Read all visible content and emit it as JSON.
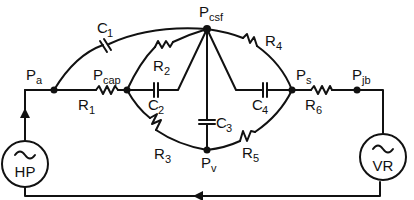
{
  "diagram": {
    "type": "electrical circuit analog model",
    "nodes": [
      {
        "id": "Pa",
        "main": "P",
        "sub": "a"
      },
      {
        "id": "Pcap",
        "main": "P",
        "sub": "cap"
      },
      {
        "id": "Pcsf",
        "main": "P",
        "sub": "csf"
      },
      {
        "id": "Ps",
        "main": "P",
        "sub": "s"
      },
      {
        "id": "Pjb",
        "main": "P",
        "sub": "jb"
      },
      {
        "id": "Pv",
        "main": "P",
        "sub": "v"
      }
    ],
    "components": [
      {
        "id": "C1",
        "kind": "capacitor",
        "main": "C",
        "sub": "1",
        "between": [
          "Pa",
          "Pcsf"
        ]
      },
      {
        "id": "R1",
        "kind": "resistor",
        "main": "R",
        "sub": "1",
        "between": [
          "Pa",
          "Pcap"
        ]
      },
      {
        "id": "R2",
        "kind": "resistor",
        "main": "R",
        "sub": "2",
        "between": [
          "Pcap",
          "Pcsf"
        ]
      },
      {
        "id": "C2",
        "kind": "capacitor",
        "main": "C",
        "sub": "2",
        "between": [
          "Pcap",
          "Pcsf"
        ]
      },
      {
        "id": "R3",
        "kind": "resistor",
        "main": "R",
        "sub": "3",
        "between": [
          "Pcap",
          "Pv"
        ]
      },
      {
        "id": "C3",
        "kind": "capacitor",
        "main": "C",
        "sub": "3",
        "between": [
          "Pcsf",
          "Pv"
        ]
      },
      {
        "id": "R4",
        "kind": "resistor",
        "main": "R",
        "sub": "4",
        "between": [
          "Pcsf",
          "Ps"
        ]
      },
      {
        "id": "C4",
        "kind": "capacitor",
        "main": "C",
        "sub": "4",
        "between": [
          "Pcsf",
          "Ps"
        ]
      },
      {
        "id": "R5",
        "kind": "resistor",
        "main": "R",
        "sub": "5",
        "between": [
          "Pv",
          "Ps"
        ]
      },
      {
        "id": "R6",
        "kind": "resistor",
        "main": "R",
        "sub": "6",
        "between": [
          "Ps",
          "Pjb"
        ]
      }
    ],
    "sources": [
      {
        "id": "HP",
        "label": "HP",
        "symbol": "~"
      },
      {
        "id": "VR",
        "label": "VR",
        "symbol": "~"
      }
    ],
    "colors": {
      "ink": "#111111",
      "background": "#ffffff"
    }
  },
  "labels": {
    "pa": {
      "main": "P",
      "sub": "a"
    },
    "pcap": {
      "main": "P",
      "sub": "cap"
    },
    "pcsf": {
      "main": "P",
      "sub": "csf"
    },
    "ps": {
      "main": "P",
      "sub": "s"
    },
    "pjb": {
      "main": "P",
      "sub": "jb"
    },
    "pv": {
      "main": "P",
      "sub": "v"
    },
    "c1": {
      "main": "C",
      "sub": "1"
    },
    "c2": {
      "main": "C",
      "sub": "2"
    },
    "c3": {
      "main": "C",
      "sub": "3"
    },
    "c4": {
      "main": "C",
      "sub": "4"
    },
    "r1": {
      "main": "R",
      "sub": "1"
    },
    "r2": {
      "main": "R",
      "sub": "2"
    },
    "r3": {
      "main": "R",
      "sub": "3"
    },
    "r4": {
      "main": "R",
      "sub": "4"
    },
    "r5": {
      "main": "R",
      "sub": "5"
    },
    "r6": {
      "main": "R",
      "sub": "6"
    },
    "hp": {
      "symbol": "~",
      "label": "HP"
    },
    "vr": {
      "symbol": "~",
      "label": "VR"
    }
  }
}
